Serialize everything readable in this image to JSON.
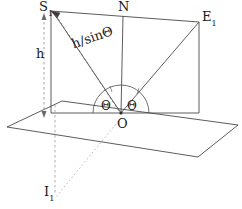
{
  "figure": {
    "kind": "geometry-diagram",
    "stroke_color": "#3a3a3a",
    "dashed_color": "#8a8a8a",
    "background_color": "#ffffff"
  },
  "labels": {
    "s1": {
      "text": "S",
      "sub": "1"
    },
    "n": {
      "text": "N",
      "sub": ""
    },
    "e1": {
      "text": "E",
      "sub": "1"
    },
    "o": {
      "text": "O",
      "sub": ""
    },
    "i1": {
      "text": "I",
      "sub": "1"
    },
    "h": {
      "text": "h",
      "sub": ""
    },
    "h_over_sin_theta": {
      "text": "h/sinΘ",
      "sub": ""
    },
    "theta_left": {
      "text": "Θ",
      "sub": ""
    },
    "theta_right": {
      "text": "Θ",
      "sub": ""
    }
  },
  "geometry": {
    "ground_plane_points": "7,127 62,101 238,125 198,157",
    "vertical_plane_points": "51,11 199,22 199,113 51,113",
    "point_O": {
      "x": 121,
      "y": 113
    },
    "point_S1": {
      "x": 51,
      "y": 11
    },
    "point_N": {
      "x": 123,
      "y": 16
    },
    "point_E1": {
      "x": 199,
      "y": 22
    },
    "point_I1": {
      "x": 55,
      "y": 192
    },
    "h_line": {
      "x": 44,
      "y_top": 17,
      "y_bottom": 114
    },
    "arc_radius": 28
  }
}
